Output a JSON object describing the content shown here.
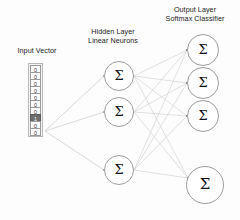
{
  "diagram": {
    "background_color": "#fdfdfd",
    "wire_color": "#c9c9c9",
    "neuron_stroke_color": "#9d9d9d",
    "highlight_color": "#6f6f6f"
  },
  "labels": {
    "input": "Input Vector",
    "hidden_line1": "Hidden Layer",
    "hidden_line2": "Linear Neurons",
    "output_line1": "Output Layer",
    "output_line2": "Softmax Classifier"
  },
  "input_vector": {
    "name": "one-hot-input-vector",
    "cells": [
      "0",
      "0",
      "0",
      "0",
      "0",
      "0",
      "0",
      "1",
      "0",
      "0"
    ],
    "active_index": 7,
    "active_value": "1",
    "inactive_value": "0",
    "count": 10
  },
  "hidden_layer": {
    "symbol": "Σ",
    "count_shown": 3,
    "neurons": [
      {
        "label": "Σ",
        "cx": 119,
        "cy": 76,
        "r": 15
      },
      {
        "label": "Σ",
        "cx": 119,
        "cy": 112,
        "r": 15
      },
      {
        "label": "Σ",
        "cx": 119,
        "cy": 170,
        "r": 15
      }
    ]
  },
  "output_layer": {
    "symbol": "Σ",
    "count_shown": 4,
    "neurons": [
      {
        "label": "Σ",
        "cx": 203,
        "cy": 50,
        "r": 16
      },
      {
        "label": "Σ",
        "cx": 203,
        "cy": 83,
        "r": 16
      },
      {
        "label": "Σ",
        "cx": 203,
        "cy": 116,
        "r": 16
      },
      {
        "label": "Σ",
        "cx": 205,
        "cy": 185,
        "r": 19
      }
    ]
  },
  "connections": {
    "input_source": {
      "x": 45,
      "y": 131
    },
    "input_to_hidden": [
      {
        "from": [
          45,
          131
        ],
        "to": [
          104,
          76
        ]
      },
      {
        "from": [
          45,
          131
        ],
        "to": [
          104,
          112
        ]
      },
      {
        "from": [
          45,
          131
        ],
        "to": [
          104,
          170
        ]
      }
    ],
    "hidden_to_output": [
      {
        "from": [
          134,
          76
        ],
        "to": [
          187,
          50
        ]
      },
      {
        "from": [
          134,
          76
        ],
        "to": [
          187,
          83
        ]
      },
      {
        "from": [
          134,
          76
        ],
        "to": [
          187,
          116
        ]
      },
      {
        "from": [
          134,
          76
        ],
        "to": [
          188,
          178
        ]
      },
      {
        "from": [
          134,
          112
        ],
        "to": [
          187,
          50
        ]
      },
      {
        "from": [
          134,
          112
        ],
        "to": [
          187,
          83
        ]
      },
      {
        "from": [
          134,
          112
        ],
        "to": [
          187,
          116
        ]
      },
      {
        "from": [
          134,
          112
        ],
        "to": [
          188,
          178
        ]
      },
      {
        "from": [
          134,
          170
        ],
        "to": [
          187,
          50
        ]
      },
      {
        "from": [
          134,
          170
        ],
        "to": [
          187,
          83
        ]
      },
      {
        "from": [
          134,
          170
        ],
        "to": [
          187,
          116
        ]
      },
      {
        "from": [
          134,
          170
        ],
        "to": [
          188,
          178
        ]
      }
    ]
  }
}
